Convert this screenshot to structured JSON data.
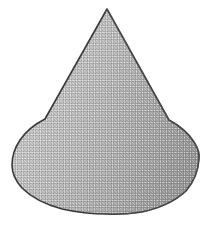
{
  "image": {
    "title": "Cone",
    "kind": "line-art-shape",
    "subject": "cone",
    "description": "Grey shaded cone with apex at top and rounded elliptical base, drawn as a scanned halftone illustration",
    "width": 210,
    "height": 226,
    "background_color": "#ffffff"
  },
  "shape": {
    "name": "cone",
    "outline_color": "#3a3a3a",
    "outline_width": "1.6",
    "fill_light": "#c2c2c2",
    "fill_mid": "#ababab",
    "fill_dark": "#8e8e8e",
    "shading_direction": "left-light-to-right-dark",
    "texture": "halftone-dither",
    "geometry": {
      "apex": {
        "x": 107,
        "y": 9
      },
      "leftmost": {
        "x": 12,
        "y": 165
      },
      "rightmost": {
        "x": 199,
        "y": 157
      },
      "bottom": {
        "x": 107,
        "y": 214
      },
      "base_center": {
        "x": 105,
        "y": 163
      },
      "base_radius_x": 93,
      "base_radius_y": 51,
      "height": 205
    },
    "path": "M 107 9 L 169 120 Q 186 129 194 142 Q 200 151 199 159 Q 198 177 186 191 Q 170 206 142 212 Q 121 215 107 214 Q 84 214 62 209 Q 36 202 22 188 Q 12 177 12 165 Q 12 152 20 140 Q 29 127 45 119 Z"
  }
}
